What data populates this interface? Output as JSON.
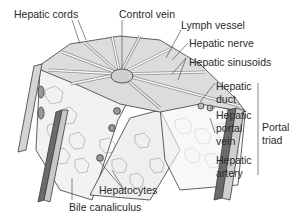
{
  "figure": {
    "labels": {
      "hepatic_cords": "Hepatic cords",
      "control_vein": "Control vein",
      "lymph_vessel": "Lymph vessel",
      "hepatic_nerve": "Hepatic nerve",
      "hepatic_sinusoids": "Hepatic sinusoids",
      "hepatic_duct_1": "Hepatic",
      "hepatic_duct_2": "duct",
      "hepatic_portal_vein_1": "Hepatic",
      "hepatic_portal_vein_2": "portal",
      "hepatic_portal_vein_3": "vein",
      "hepatic_artery_1": "Hepatic",
      "hepatic_artery_2": "artery",
      "portal_triad_1": "Portal",
      "portal_triad_2": "triad",
      "hepatocytes": "Hepatocytes",
      "bile_canaliculus": "Bile canaliculus"
    },
    "colors": {
      "outline": "#3a3a3a",
      "tissue_light": "#e6e6e6",
      "tissue_mid": "#bdbdbd",
      "vessel_dark": "#6b6b6b",
      "text": "#2a2a2a"
    }
  }
}
